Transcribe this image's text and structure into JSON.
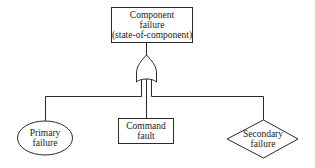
{
  "diagram": {
    "type": "fault-tree",
    "top_event": {
      "lines": [
        "Component",
        "failure",
        "(state-of-component)"
      ],
      "shape": "rectangle"
    },
    "gate": {
      "type": "OR",
      "icon": "or-gate-icon"
    },
    "inputs": [
      {
        "id": "primary",
        "lines": [
          "Primary",
          "failure"
        ],
        "shape": "circle"
      },
      {
        "id": "command",
        "lines": [
          "Command",
          "fault"
        ],
        "shape": "rectangle"
      },
      {
        "id": "secondary",
        "lines": [
          "Secondary",
          "failure"
        ],
        "shape": "diamond"
      }
    ]
  }
}
